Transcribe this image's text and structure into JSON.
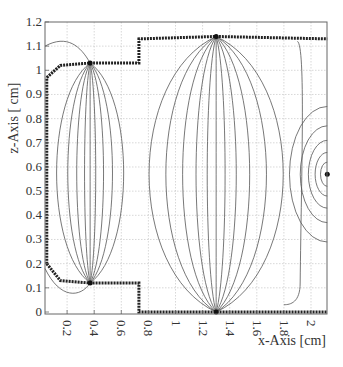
{
  "chart_data": {
    "type": "contour",
    "title": "",
    "xlabel": "x-Axis [cm]",
    "ylabel": "z-Axis [ cm]",
    "xlim": [
      0.04,
      2.12
    ],
    "ylim": [
      -0.01,
      1.2
    ],
    "grid": true,
    "x_ticks": [
      "0.2",
      "0.4",
      "0.6",
      "0.8",
      "1",
      "1.2",
      "1.4",
      "1.6",
      "1.8",
      "2"
    ],
    "x_tick_values": [
      0.2,
      0.4,
      0.6,
      0.8,
      1.0,
      1.2,
      1.4,
      1.6,
      1.8,
      2.0
    ],
    "y_ticks": [
      "0",
      "0.1",
      "0.2",
      "0.3",
      "0.4",
      "0.5",
      "0.6",
      "0.7",
      "0.8",
      "0.9",
      "1",
      "1.1",
      "1.2"
    ],
    "y_tick_values": [
      0,
      0.1,
      0.2,
      0.3,
      0.4,
      0.5,
      0.6,
      0.7,
      0.8,
      0.9,
      1.0,
      1.1,
      1.2
    ],
    "electrodes": [
      {
        "name": "left-upper-boundary",
        "points": [
          [
            0.05,
            0.97
          ],
          [
            0.15,
            1.02
          ],
          [
            0.37,
            1.03
          ],
          [
            0.73,
            1.03
          ],
          [
            0.73,
            1.13
          ],
          [
            1.3,
            1.14
          ],
          [
            2.12,
            1.13
          ]
        ]
      },
      {
        "name": "left-lower-boundary",
        "points": [
          [
            0.05,
            0.2
          ],
          [
            0.15,
            0.13
          ],
          [
            0.37,
            0.12
          ],
          [
            0.73,
            0.12
          ],
          [
            0.73,
            0.0
          ],
          [
            1.3,
            0.0
          ],
          [
            2.12,
            0.0
          ]
        ]
      },
      {
        "name": "left-curved-wall",
        "points": [
          [
            0.05,
            0.2
          ],
          [
            0.05,
            0.97
          ]
        ]
      }
    ],
    "focal_points": [
      {
        "x": 0.37,
        "z": 1.03
      },
      {
        "x": 0.37,
        "z": 0.12
      },
      {
        "x": 1.3,
        "z": 1.14
      },
      {
        "x": 1.3,
        "z": 0.0
      },
      {
        "x": 2.12,
        "z": 0.57
      }
    ],
    "contour_labels": [
      "1000",
      "1000",
      "500",
      "500",
      "1000"
    ],
    "annotations": [
      "dense contour lines converging at electrode tips",
      "concentric contours near right edge at z≈0.57"
    ]
  }
}
